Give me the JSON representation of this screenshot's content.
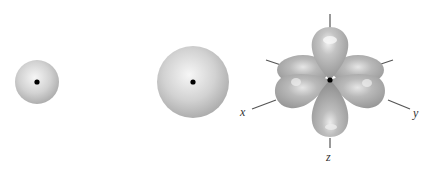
{
  "diagram": {
    "orbitals": [
      {
        "name": "1s",
        "shape": "small sphere",
        "center": [
          37,
          82
        ],
        "radius": 22
      },
      {
        "name": "2s",
        "shape": "large sphere",
        "center": [
          193,
          82
        ],
        "radius": 36
      },
      {
        "name": "3d",
        "shape": "four-lobe cloverleaf",
        "center": [
          330,
          80
        ]
      }
    ],
    "axes": {
      "x_label": "x",
      "y_label": "y",
      "z_label": "z"
    },
    "colors": {
      "sphere_light": "#f4f4f4",
      "sphere_dark": "#a8a8a8",
      "lobe_light": "#e6e6e6",
      "lobe_dark": "#909090",
      "nucleus": "#000000",
      "axis_line": "#555555"
    }
  }
}
